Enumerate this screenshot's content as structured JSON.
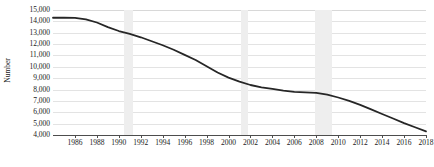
{
  "chart_data": {
    "type": "line",
    "title": "",
    "xlabel": "",
    "ylabel": "Number",
    "xlim": [
      1984,
      2018
    ],
    "ylim": [
      4000,
      15000
    ],
    "grid": true,
    "legend": "none",
    "y_ticks": [
      15000,
      14000,
      13000,
      12000,
      11000,
      10000,
      9000,
      8000,
      7000,
      6000,
      5000,
      4000
    ],
    "y_tick_labels": [
      "15,000",
      "14,000",
      "13,000",
      "12,000",
      "11,000",
      "10,000",
      "9,000",
      "8,000",
      "7,000",
      "6,000",
      "5,000",
      "4,000"
    ],
    "x_ticks": [
      1986,
      1988,
      1990,
      1992,
      1994,
      1996,
      1998,
      2000,
      2002,
      2004,
      2006,
      2008,
      2010,
      2012,
      2014,
      2016,
      2018
    ],
    "x_tick_labels": [
      "1986",
      "1988",
      "1990",
      "1992",
      "1994",
      "1996",
      "1998",
      "2000",
      "2002",
      "2004",
      "2006",
      "2008",
      "2010",
      "2012",
      "2014",
      "2016",
      "2018"
    ],
    "series": [
      {
        "name": "Number",
        "color": "#262626",
        "x": [
          1984,
          1985,
          1986,
          1987,
          1988,
          1989,
          1990,
          1991,
          1992,
          1993,
          1994,
          1995,
          1996,
          1997,
          1998,
          1999,
          2000,
          2001,
          2002,
          2003,
          2004,
          2005,
          2006,
          2007,
          2008,
          2009,
          2010,
          2011,
          2012,
          2013,
          2014,
          2015,
          2016,
          2017,
          2018
        ],
        "values": [
          14320,
          14330,
          14300,
          14180,
          13900,
          13500,
          13150,
          12900,
          12600,
          12250,
          11900,
          11500,
          11050,
          10600,
          10050,
          9500,
          9050,
          8700,
          8400,
          8200,
          8050,
          7900,
          7800,
          7750,
          7700,
          7550,
          7300,
          7000,
          6650,
          6250,
          5850,
          5450,
          5050,
          4680,
          4320
        ]
      }
    ],
    "shaded_bands": [
      {
        "name": "recession-1990-1991",
        "start": 1990.5,
        "end": 1991.3
      },
      {
        "name": "recession-2001",
        "start": 2001.1,
        "end": 2001.8
      },
      {
        "name": "recession-2007-2009",
        "start": 2007.9,
        "end": 2009.4
      }
    ]
  }
}
